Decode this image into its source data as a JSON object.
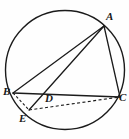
{
  "figure": {
    "background_color": "#fefefe",
    "stroke_color": "#1b1b1b",
    "label_color": "#1a1a1a",
    "width": 129,
    "height": 139
  },
  "circle": {
    "name": "circumscribed-circle",
    "cx": 65,
    "cy": 70,
    "r": 59.5,
    "stroke_width": 1.4
  },
  "points": [
    {
      "id": "A",
      "label": "A",
      "x": 104,
      "y": 26,
      "label_x": 106,
      "label_y": 11
    },
    {
      "id": "B",
      "label": "B",
      "x": 13,
      "y": 93,
      "label_x": 3,
      "label_y": 86
    },
    {
      "id": "C",
      "label": "C",
      "x": 120,
      "y": 97,
      "label_x": 119,
      "label_y": 92
    },
    {
      "id": "D",
      "label": "D",
      "x": 46,
      "y": 93,
      "label_x": 45,
      "label_y": 93
    },
    {
      "id": "E",
      "label": "E",
      "x": 29,
      "y": 110,
      "label_x": 19,
      "label_y": 113
    }
  ],
  "segments": [
    {
      "id": "AB",
      "from": "A",
      "to": "B",
      "style": "solid",
      "stroke_width": 1.3
    },
    {
      "id": "AC",
      "from": "A",
      "to": "C",
      "style": "solid",
      "stroke_width": 1.3
    },
    {
      "id": "AE",
      "from": "A",
      "to": "E",
      "style": "solid",
      "stroke_width": 1.3
    },
    {
      "id": "BC",
      "from": "B",
      "to": "C",
      "style": "solid",
      "stroke_width": 1.3
    },
    {
      "id": "BE",
      "from": "B",
      "to": "E",
      "style": "dashed",
      "stroke_width": 1.1
    },
    {
      "id": "EC",
      "from": "E",
      "to": "C",
      "style": "dashed",
      "stroke_width": 1.1
    }
  ],
  "labels": {
    "A": "A",
    "B": "B",
    "C": "C",
    "D": "D",
    "E": "E"
  }
}
